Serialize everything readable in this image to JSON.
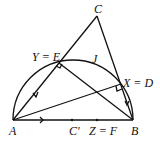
{
  "diagram": {
    "type": "geometry",
    "points": {
      "A": {
        "label": "A",
        "x": 13,
        "y": 120
      },
      "B": {
        "label": "B",
        "x": 133,
        "y": 120
      },
      "C": {
        "label": "C",
        "x": 97,
        "y": 16
      },
      "E": {
        "label": "Y = E",
        "x": 59,
        "y": 63
      },
      "D": {
        "label": "X = D",
        "x": 121,
        "y": 84
      },
      "Cprime": {
        "label": "C'",
        "x": 72,
        "y": 120
      },
      "F": {
        "label": "Z = F",
        "x": 97,
        "y": 120
      },
      "J": {
        "label": "J",
        "x": 94,
        "y": 61
      }
    },
    "labels": {
      "A": "A",
      "B": "B",
      "C": "C",
      "E": "Y = E",
      "D": "X = D",
      "Cprime": "C'",
      "F": "Z = F",
      "J": "J"
    },
    "segments": [
      "AB",
      "AC",
      "BC",
      "AD",
      "BE"
    ],
    "arcs": [
      "semicircle on AB through E, J, D"
    ],
    "right_angles": [
      "E (BE ⟂ AC)",
      "D (AD ⟂ BC)"
    ],
    "arrows": [
      "on AE toward A",
      "on AB toward B",
      "on DB toward B"
    ]
  }
}
